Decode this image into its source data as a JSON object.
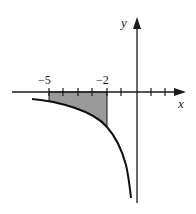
{
  "figure": {
    "x_axis_label": "x",
    "y_axis_label": "y",
    "tick_labels": [
      {
        "value": -5,
        "text": "−5"
      },
      {
        "value": -2,
        "text": "−2"
      }
    ],
    "ticks_x": [
      -5,
      -4,
      -3,
      -2,
      -1,
      1,
      2
    ],
    "shaded_region": {
      "from": -5,
      "to": -2,
      "color": "#9a9a9a"
    },
    "curve_color": "#111111",
    "axis_color": "#1a1a1a"
  }
}
